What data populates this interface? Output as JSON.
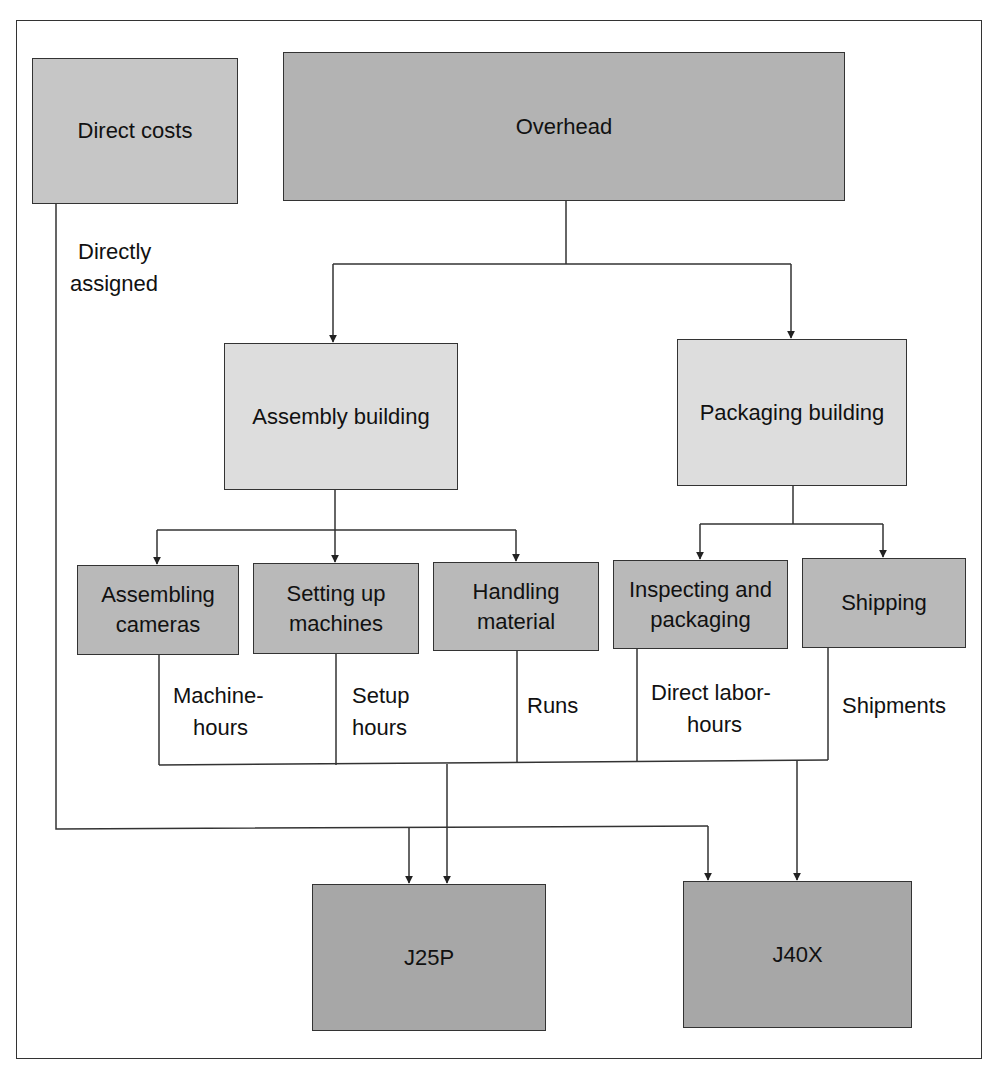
{
  "diagram": {
    "title": "",
    "top_nodes": {
      "direct_costs": {
        "label": "Direct costs",
        "color": "#c6c6c6"
      },
      "overhead": {
        "label": "Overhead",
        "color": "#b3b3b3"
      }
    },
    "buildings": [
      {
        "id": "assembly",
        "label": "Assembly building",
        "color": "#dddddd"
      },
      {
        "id": "packaging",
        "label": "Packaging building",
        "color": "#dddddd"
      }
    ],
    "activities": [
      {
        "id": "assembling",
        "line1": "Assembling",
        "line2": "cameras",
        "driver_line1": "Machine-",
        "driver_line2": "hours"
      },
      {
        "id": "setup",
        "line1": "Setting up",
        "line2": "machines",
        "driver_line1": "Setup",
        "driver_line2": "hours"
      },
      {
        "id": "handling",
        "line1": "Handling",
        "line2": "material",
        "driver_line1": "Runs",
        "driver_line2": ""
      },
      {
        "id": "inspecting",
        "line1": "Inspecting and",
        "line2": "packaging",
        "driver_line1": "Direct labor-",
        "driver_line2": "hours"
      },
      {
        "id": "shipping",
        "line1": "Shipping",
        "line2": "",
        "driver_line1": "Shipments",
        "driver_line2": ""
      }
    ],
    "activity_color": "#b9b9b9",
    "direct_label": {
      "line1": "Directly",
      "line2": "assigned"
    },
    "products": [
      {
        "id": "j25p",
        "label": "J25P",
        "color": "#a7a7a7"
      },
      {
        "id": "j40x",
        "label": "J40X",
        "color": "#a7a7a7"
      }
    ],
    "line_color": "#333333"
  }
}
